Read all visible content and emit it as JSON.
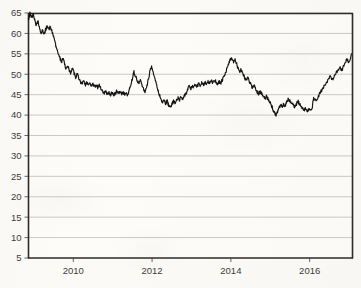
{
  "chart_data": {
    "type": "line",
    "title": "",
    "subtitle": "",
    "xlabel": "",
    "ylabel": "",
    "grid": "horizontal",
    "legend": "none",
    "xlim": [
      2008.85,
      2017.1
    ],
    "ylim": [
      5,
      65
    ],
    "yticks": [
      5,
      10,
      15,
      20,
      25,
      30,
      35,
      40,
      45,
      50,
      55,
      60,
      65
    ],
    "ytick_labels": [
      "5",
      "10",
      "15",
      "20",
      "25",
      "30",
      "35",
      "40",
      "45",
      "50",
      "55",
      "60",
      "65"
    ],
    "xticks": [
      2010,
      2012,
      2014,
      2016
    ],
    "xtick_labels": [
      "2010",
      "2012",
      "2014",
      "2016"
    ],
    "series": [
      {
        "name": "series-1",
        "color": "#141414",
        "x": [
          2008.86,
          2008.9,
          2008.94,
          2008.98,
          2009.02,
          2009.06,
          2009.1,
          2009.14,
          2009.18,
          2009.22,
          2009.26,
          2009.3,
          2009.34,
          2009.38,
          2009.42,
          2009.46,
          2009.5,
          2009.54,
          2009.58,
          2009.62,
          2009.66,
          2009.7,
          2009.74,
          2009.78,
          2009.82,
          2009.86,
          2009.9,
          2009.94,
          2009.98,
          2010.02,
          2010.06,
          2010.1,
          2010.14,
          2010.18,
          2010.22,
          2010.26,
          2010.3,
          2010.34,
          2010.38,
          2010.42,
          2010.46,
          2010.5,
          2010.54,
          2010.58,
          2010.62,
          2010.66,
          2010.7,
          2010.74,
          2010.78,
          2010.82,
          2010.86,
          2010.9,
          2010.94,
          2010.98,
          2011.02,
          2011.06,
          2011.1,
          2011.14,
          2011.18,
          2011.22,
          2011.26,
          2011.3,
          2011.34,
          2011.38,
          2011.42,
          2011.46,
          2011.5,
          2011.54,
          2011.58,
          2011.62,
          2011.66,
          2011.7,
          2011.74,
          2011.78,
          2011.82,
          2011.86,
          2011.9,
          2011.94,
          2011.98,
          2012.02,
          2012.06,
          2012.1,
          2012.14,
          2012.18,
          2012.22,
          2012.26,
          2012.3,
          2012.34,
          2012.38,
          2012.42,
          2012.46,
          2012.5,
          2012.54,
          2012.58,
          2012.62,
          2012.66,
          2012.7,
          2012.74,
          2012.78,
          2012.82,
          2012.86,
          2012.9,
          2012.94,
          2012.98,
          2013.02,
          2013.06,
          2013.1,
          2013.14,
          2013.18,
          2013.22,
          2013.26,
          2013.3,
          2013.34,
          2013.38,
          2013.42,
          2013.46,
          2013.5,
          2013.54,
          2013.58,
          2013.62,
          2013.66,
          2013.7,
          2013.74,
          2013.78,
          2013.82,
          2013.86,
          2013.9,
          2013.94,
          2013.98,
          2014.02,
          2014.06,
          2014.1,
          2014.14,
          2014.18,
          2014.22,
          2014.26,
          2014.3,
          2014.34,
          2014.38,
          2014.42,
          2014.46,
          2014.5,
          2014.54,
          2014.58,
          2014.62,
          2014.66,
          2014.7,
          2014.74,
          2014.78,
          2014.82,
          2014.86,
          2014.9,
          2014.94,
          2014.98,
          2015.02,
          2015.06,
          2015.1,
          2015.14,
          2015.18,
          2015.22,
          2015.26,
          2015.3,
          2015.34,
          2015.38,
          2015.42,
          2015.46,
          2015.5,
          2015.54,
          2015.58,
          2015.62,
          2015.66,
          2015.7,
          2015.74,
          2015.78,
          2015.82,
          2015.86,
          2015.9,
          2015.94,
          2015.98,
          2016.02,
          2016.06,
          2016.1,
          2016.14,
          2016.18,
          2016.22,
          2016.26,
          2016.3,
          2016.34,
          2016.38,
          2016.42,
          2016.46,
          2016.5,
          2016.54,
          2016.58,
          2016.62,
          2016.66,
          2016.7,
          2016.74,
          2016.78,
          2016.82,
          2016.86,
          2016.9,
          2016.94,
          2016.98,
          2017.02,
          2017.06
        ],
        "y": [
          63.2,
          65.0,
          64.0,
          64.8,
          63.5,
          62.0,
          63.0,
          61.5,
          60.2,
          60.8,
          59.8,
          61.0,
          61.8,
          61.2,
          61.6,
          60.5,
          59.0,
          57.5,
          56.2,
          55.0,
          54.0,
          53.0,
          53.8,
          52.5,
          51.2,
          52.0,
          51.0,
          50.0,
          51.5,
          50.3,
          49.2,
          50.0,
          49.0,
          48.2,
          47.6,
          48.3,
          47.4,
          48.0,
          47.2,
          47.8,
          47.0,
          47.6,
          47.0,
          47.4,
          46.8,
          47.2,
          46.5,
          46.0,
          45.4,
          46.0,
          45.2,
          45.6,
          45.0,
          45.4,
          44.9,
          45.2,
          45.8,
          45.3,
          45.7,
          45.2,
          45.6,
          45.1,
          45.5,
          45.0,
          46.2,
          47.6,
          49.0,
          50.5,
          49.6,
          48.6,
          47.8,
          48.5,
          47.5,
          46.6,
          45.4,
          46.8,
          48.4,
          50.5,
          52.0,
          51.0,
          49.5,
          48.0,
          46.5,
          45.0,
          44.0,
          43.2,
          43.8,
          42.8,
          43.5,
          42.4,
          41.8,
          42.6,
          43.4,
          42.9,
          43.6,
          44.2,
          43.8,
          44.5,
          43.9,
          44.6,
          45.4,
          46.2,
          47.0,
          46.4,
          47.2,
          46.8,
          47.5,
          47.0,
          47.6,
          47.2,
          47.8,
          47.4,
          48.0,
          47.6,
          48.2,
          47.8,
          48.4,
          48.0,
          48.6,
          48.2,
          47.6,
          48.2,
          47.8,
          48.5,
          49.2,
          50.2,
          51.4,
          52.6,
          53.4,
          53.8,
          53.0,
          53.6,
          52.6,
          51.6,
          50.6,
          51.2,
          50.2,
          49.4,
          48.6,
          49.2,
          48.4,
          47.6,
          46.8,
          47.4,
          46.6,
          45.8,
          45.2,
          45.8,
          45.2,
          44.6,
          44.0,
          44.6,
          44.0,
          43.4,
          42.6,
          41.6,
          40.6,
          40.0,
          40.6,
          41.6,
          42.4,
          42.0,
          42.6,
          42.2,
          43.2,
          44.0,
          43.4,
          43.0,
          42.4,
          42.0,
          42.6,
          43.4,
          42.8,
          42.2,
          41.8,
          41.2,
          41.6,
          41.0,
          41.4,
          41.0,
          41.6,
          41.2,
          41.8,
          42.2,
          41.8,
          42.4,
          42.0,
          42.6,
          43.2,
          44.0,
          44.8,
          45.4,
          44.8,
          45.4,
          44.8,
          45.2,
          44.6,
          45.2,
          44.6,
          45.0,
          44.4,
          45.0,
          44.4,
          44.8,
          44.2,
          44.8
        ]
      }
    ],
    "series_continued": {
      "note": "tail segment",
      "x": [
        2016.1,
        2016.16,
        2016.22,
        2016.28,
        2016.34,
        2016.4,
        2016.46,
        2016.52,
        2016.58,
        2016.64,
        2016.7,
        2016.76,
        2016.82,
        2016.88,
        2016.94,
        2017.0,
        2017.06
      ],
      "y": [
        44.2,
        43.4,
        44.6,
        45.6,
        46.6,
        47.4,
        48.6,
        49.4,
        48.8,
        50.0,
        50.8,
        51.6,
        51.0,
        52.4,
        53.6,
        53.0,
        55.0
      ]
    },
    "annotations": [],
    "summary": {
      "start_value": "63.2",
      "max_value": "65.0",
      "min_value": "40.0",
      "end_value": "55.0"
    }
  }
}
